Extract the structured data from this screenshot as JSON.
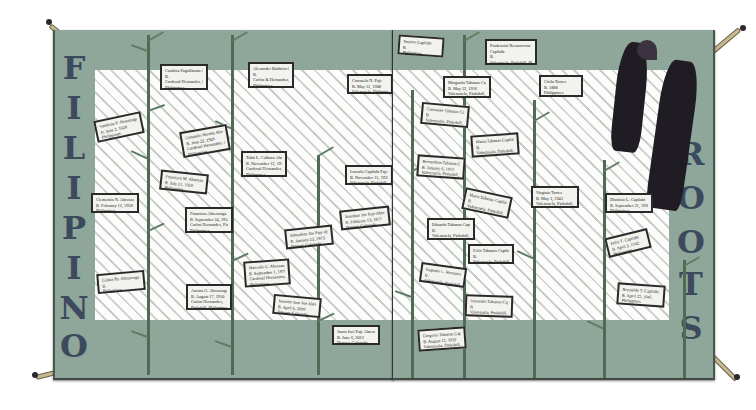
{
  "title_left": [
    "F",
    "I",
    "L",
    "I",
    "P",
    "I",
    "N",
    "O"
  ],
  "title_right": [
    "R",
    "O",
    "O",
    "T",
    "S"
  ],
  "colors": {
    "border": "#8ea79a",
    "lettering": "#3d4a5e",
    "bamboo": "#4f6a55",
    "dancers": "#1f1c24",
    "mat": "#e7e6df"
  },
  "labels_left": [
    {
      "lines": [
        "Catalina Pagalilauan Abrenzuga",
        "B.",
        "Cardenal Hernandez, Pinkshill",
        "Philippines"
      ]
    },
    {
      "lines": [
        "Alexander Baldwin Calbaca",
        "B.",
        "Carlos & Hernandez, Pinkshill",
        "Philippines"
      ]
    },
    {
      "lines": [
        "Consuelo N. Paje",
        "B. May 12, 1908",
        "Valenzuela, Philippines"
      ]
    },
    {
      "lines": [
        "Sandrina P. Abrenzuga",
        "B. June 2, 1928",
        "Philippines"
      ]
    },
    {
      "lines": [
        "Consuelo Hartela Abrenzuga",
        "B. June 22, 1926",
        "Cardenal Hernandez, Pinkshill",
        "Philippines"
      ]
    },
    {
      "lines": [
        "Tobit L. Calbaca Abrenzuga",
        "B. November 12, 1932",
        "Cardenal Hernandez, Pinkshill",
        "Philippines"
      ]
    },
    {
      "lines": [
        "Lorcolo Capilaht Paje",
        "B. November 15, 1933",
        "Valenzuela, Pinkshill, Philippines"
      ]
    },
    {
      "lines": [
        "Francisca M. Abrenzuga",
        "B. July 21, 1959",
        "Philippines"
      ]
    },
    {
      "lines": [
        "Clementia N. Abrenzuga",
        "B. February 12, 1958",
        "Philippines"
      ]
    },
    {
      "lines": [
        "Francisco Abrenzuga",
        "B. September 24, 1954",
        "Carlos Hernandez, Pinkshill",
        "Philippines"
      ]
    },
    {
      "lines": [
        "Johnathon Joe Paje Abrenzuga",
        "B. January 23, 1973",
        "Denver, Colorado"
      ]
    },
    {
      "lines": [
        "Jonathan Joe Paje Abrenzuga",
        "B. February 13, 1977",
        "Denver, Colorado"
      ]
    },
    {
      "lines": [
        "Marcello C. Abrenzuga",
        "B. September 1, 1979",
        "Cardenal Hernandez, Pinkshill",
        "Philippines"
      ]
    },
    {
      "lines": [
        "Celina Ph. Abrenzuga",
        "B.",
        "Philippines"
      ]
    },
    {
      "lines": [
        "Aurora G. Abrenzuga",
        "B. August 17, 1950",
        "Carlos Hernandez,",
        "Pinkshill, Philippines"
      ]
    },
    {
      "lines": [
        "Jennifer Ann Joe Abrenzuga",
        "B. April 6, 2009",
        "Denver, Colorado"
      ]
    },
    {
      "lines": [
        "Jason Joel Paje Abrenzuga",
        "B. June 6, 2012",
        "Denver, Colorado"
      ]
    }
  ],
  "labels_right": [
    {
      "lines": [
        "Jimiros Capilaht",
        "B.",
        "Philippines"
      ]
    },
    {
      "lines": [
        "Prudencial Ressurccion Tabanas",
        "Capilaht",
        "B.",
        "Valenzuela, Pinkshill, Philippines"
      ]
    },
    {
      "lines": [
        "Margarita Tabanas Capilaht",
        "B. May 12, 1916",
        "Valenzuela, Pinkshill, Philippines"
      ]
    },
    {
      "lines": [
        "Cirilo Torres",
        "B. 1888",
        "Philippines"
      ]
    },
    {
      "lines": [
        "Constante Tabanas Capilaht",
        "B.",
        "Valenzuela, Pinkshill, Philippines"
      ]
    },
    {
      "lines": [
        "Maria Tabanas Capilaht",
        "B.",
        "Valenzuela, Pinkshill, Philippines"
      ]
    },
    {
      "lines": [
        "Bernardino Tabanas Capilaht",
        "B. January 6, 1915",
        "Valenzuela, Pinkshill, Philippines"
      ]
    },
    {
      "lines": [
        "Maria Tabanas Capilaht",
        "B.",
        "Valenzuela, Pinkshill, Philippines"
      ]
    },
    {
      "lines": [
        "Virginia Torres",
        "B. May 3, 1943",
        "Valenzuela, Pinkshill, Philippines"
      ]
    },
    {
      "lines": [
        "Dionisio L. Capilaht",
        "B. September 21, 1920",
        "Philippines"
      ]
    },
    {
      "lines": [
        "Eduardo Tabanas Capilaht",
        "B.",
        "Valenzuela, Pinkshill, Philippines"
      ]
    },
    {
      "lines": [
        "Felix Tabanas Capilaht",
        "B.",
        "Valenzuela, Pinkshill, Philippines"
      ]
    },
    {
      "lines": [
        "Felix T. Capilaht",
        "B. April 2, 1942",
        "Philippines"
      ]
    },
    {
      "lines": [
        "Eugenio C. Ressureccion",
        "B.",
        "Valenzuela, Pinkshill, Philippines"
      ]
    },
    {
      "lines": [
        "Amorsito Tabanas Capilaht",
        "B.",
        "Valenzuela, Pinkshill, Philippines"
      ]
    },
    {
      "lines": [
        "Reynaldo T. Capilaht",
        "B. April 25, 1945",
        "Philippines"
      ]
    },
    {
      "lines": [
        "Gregorio Tabanas Capilaht",
        "B. August 12, 1932",
        "Valenzuela, Pinkshill, Philippines"
      ]
    }
  ]
}
